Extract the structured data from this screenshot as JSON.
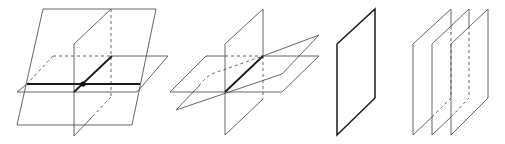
{
  "figure": {
    "colors": {
      "line": "#555555",
      "emphasis": "#1a1a1a",
      "background": "#ffffff"
    },
    "panels": [
      {
        "id": "panel-1",
        "name": "three planes intersecting at a single point",
        "planes": [
          {
            "type": "tilted",
            "points": [
              [
                43,
                9
              ],
              [
                156,
                9
              ],
              [
                132,
                125
              ],
              [
                17,
                125
              ]
            ]
          },
          {
            "type": "vertical",
            "points": [
              [
                74,
                44
              ],
              [
                111,
                9
              ],
              [
                111,
                97
              ],
              [
                74,
                136
              ]
            ]
          },
          {
            "type": "horizontal",
            "points": [
              [
                53,
                56
              ],
              [
                168,
                56
              ],
              [
                137,
                92
              ],
              [
                17,
                92
              ]
            ]
          }
        ],
        "intersection_point": [
          83,
          84
        ]
      },
      {
        "id": "panel-2",
        "name": "three planes sharing a common line",
        "planes": [
          {
            "type": "vertical",
            "points": [
              [
                225,
                44
              ],
              [
                263,
                9
              ],
              [
                263,
                99
              ],
              [
                225,
                135
              ]
            ]
          },
          {
            "type": "horizontal",
            "points": [
              [
                206,
                56
              ],
              [
                319,
                56
              ],
              [
                282,
                92
              ],
              [
                170,
                92
              ]
            ]
          },
          {
            "type": "tilted",
            "points": [
              [
                212,
                73
              ],
              [
                319,
                35
              ],
              [
                282,
                74
              ],
              [
                176,
                110
              ]
            ]
          }
        ],
        "common_line": [
          [
            225,
            92
          ],
          [
            263,
            56
          ]
        ]
      },
      {
        "id": "panel-3",
        "name": "three coincident planes",
        "planes": [
          {
            "type": "vertical",
            "points": [
              [
                337,
                44
              ],
              [
                375,
                9
              ],
              [
                375,
                98
              ],
              [
                337,
                135
              ]
            ]
          }
        ]
      },
      {
        "id": "panel-4",
        "name": "three parallel planes",
        "planes": [
          {
            "type": "vertical",
            "points": [
              [
                413,
                44
              ],
              [
                451,
                9
              ],
              [
                451,
                98
              ],
              [
                413,
                135
              ]
            ]
          },
          {
            "type": "vertical",
            "points": [
              [
                432,
                44
              ],
              [
                469,
                9
              ],
              [
                469,
                98
              ],
              [
                432,
                135
              ]
            ]
          },
          {
            "type": "vertical",
            "points": [
              [
                451,
                44
              ],
              [
                488,
                9
              ],
              [
                488,
                98
              ],
              [
                451,
                135
              ]
            ]
          }
        ]
      }
    ]
  }
}
